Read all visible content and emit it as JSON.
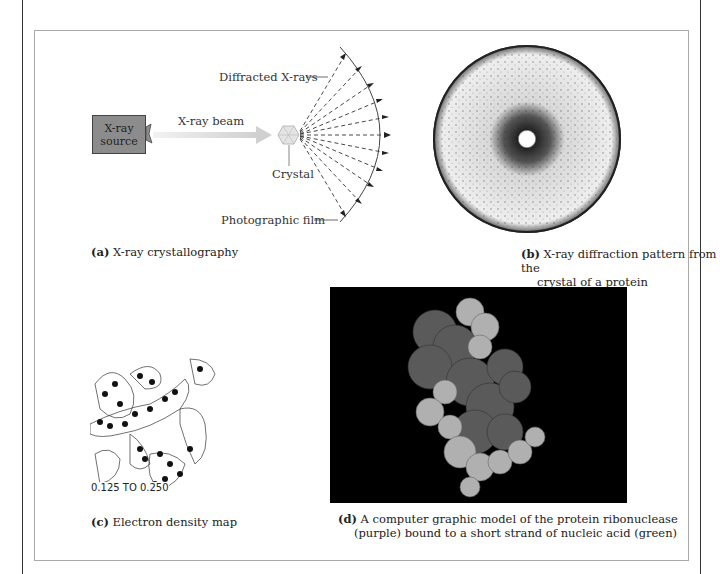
{
  "figure": {
    "panel_a": {
      "source_label_line1": "X-ray",
      "source_label_line2": "source",
      "beam_label": "X-ray beam",
      "crystal_label": "Crystal",
      "diffracted_label": "Diffracted X-rays",
      "film_label": "Photographic film",
      "caption_letter": "(a)",
      "caption_text": " X-ray crystallography"
    },
    "panel_b": {
      "caption_letter": "(b)",
      "caption_line1": " X-ray diffraction pattern from the",
      "caption_line2": "crystal of a protein"
    },
    "panel_c": {
      "map_label": "0.125 TO 0.250",
      "caption_letter": "(c)",
      "caption_text": " Electron density map"
    },
    "panel_d": {
      "caption_letter": "(d)",
      "caption_line1": " A computer graphic model of the protein ribonuclease",
      "caption_line2": "(purple) bound to a short strand of nucleic acid (green)"
    },
    "colors": {
      "source_box": "#8c8c8c",
      "beam": "#d8d8d8",
      "model_bg": "#000000",
      "protein": "#5a5a5a",
      "nucleic_acid": "#b0b0b0"
    }
  }
}
